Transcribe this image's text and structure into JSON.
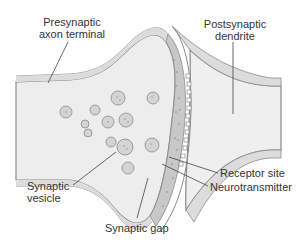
{
  "diagram": {
    "labels": {
      "presynaptic_line1": "Presynaptic",
      "presynaptic_line2": "axon terminal",
      "postsynaptic_line1": "Postsynaptic",
      "postsynaptic_line2": "dendrite",
      "receptor_site": "Receptor site",
      "neurotransmitter": "Neurotransmitter",
      "vesicle_line1": "Synaptic",
      "vesicle_line2": "vesicle",
      "synaptic_gap": "Synaptic gap"
    },
    "colors": {
      "membrane_outline": "#8a8a8a",
      "membrane_fill": "#d9d9d9",
      "cytoplasm_fill": "#ececec",
      "vesicle_fill": "#d4d4d4",
      "leader_line": "#444444",
      "text": "#333333"
    }
  }
}
